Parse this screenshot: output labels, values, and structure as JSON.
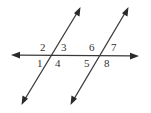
{
  "diagram": {
    "type": "parallel-lines-transversal",
    "colors": {
      "line": "#3a3a3a",
      "label": "#333333",
      "background": "#ffffff"
    },
    "transversal": {
      "start": [
        12,
        55
      ],
      "end": [
        138,
        56
      ]
    },
    "parallel_lines": [
      {
        "name": "left-line",
        "top": [
          80,
          8
        ],
        "bottom": [
          22,
          104
        ],
        "intersection": [
          50,
          56
        ]
      },
      {
        "name": "right-line",
        "top": [
          128,
          8
        ],
        "bottom": [
          71,
          104
        ],
        "intersection": [
          98,
          56
        ]
      }
    ],
    "angle_labels": [
      {
        "id": "1",
        "text": "1",
        "x": 37,
        "y": 67
      },
      {
        "id": "2",
        "text": "2",
        "x": 40,
        "y": 51
      },
      {
        "id": "3",
        "text": "3",
        "x": 61,
        "y": 51
      },
      {
        "id": "4",
        "text": "4",
        "x": 55,
        "y": 67
      },
      {
        "id": "5",
        "text": "5",
        "x": 84,
        "y": 67
      },
      {
        "id": "6",
        "text": "6",
        "x": 89,
        "y": 51
      },
      {
        "id": "7",
        "text": "7",
        "x": 111,
        "y": 51
      },
      {
        "id": "8",
        "text": "8",
        "x": 104,
        "y": 67
      }
    ]
  }
}
